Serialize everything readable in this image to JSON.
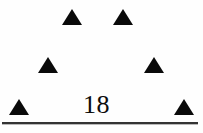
{
  "figure": {
    "background_color": "#fefefe",
    "ink_color": "#0a0a0a",
    "page_number": "18",
    "number_color": "#0d0d0d",
    "number_font_size_px": 26,
    "number_left_px": 83,
    "number_top_px": 92,
    "rule_color": "#333333",
    "rule_shadow_color": "#b9b9b9",
    "rule_left_px": 2,
    "rule_top_px": 122,
    "rule_width_px": 196,
    "rule_height_px": 2,
    "rule_shadow_top_px": 124,
    "rule_shadow_height_px": 1,
    "markers": [
      {
        "name": "triangle-top-left",
        "row": "top",
        "left_px": 62,
        "top_px": 9,
        "width_px": 20,
        "height_px": 16,
        "color": "#0a0a0a"
      },
      {
        "name": "triangle-top-right",
        "row": "top",
        "left_px": 113,
        "top_px": 9,
        "width_px": 20,
        "height_px": 16,
        "color": "#0a0a0a"
      },
      {
        "name": "triangle-middle-left",
        "row": "middle",
        "left_px": 38,
        "top_px": 57,
        "width_px": 20,
        "height_px": 16,
        "color": "#0a0a0a"
      },
      {
        "name": "triangle-middle-right",
        "row": "middle",
        "left_px": 144,
        "top_px": 57,
        "width_px": 20,
        "height_px": 16,
        "color": "#0a0a0a"
      },
      {
        "name": "triangle-bottom-left",
        "row": "bottom",
        "left_px": 9,
        "top_px": 99,
        "width_px": 20,
        "height_px": 16,
        "color": "#0a0a0a"
      },
      {
        "name": "triangle-bottom-right",
        "row": "bottom",
        "left_px": 174,
        "top_px": 99,
        "width_px": 20,
        "height_px": 16,
        "color": "#0a0a0a"
      }
    ]
  }
}
